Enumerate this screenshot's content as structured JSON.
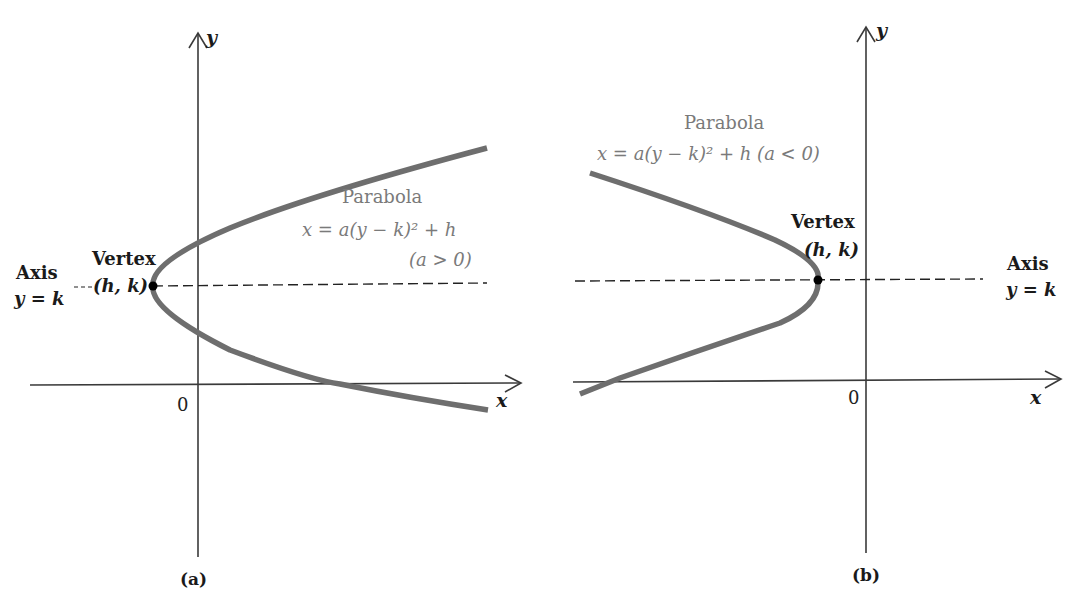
{
  "figure": {
    "panels": [
      {
        "id": "a",
        "caption": "(a)",
        "y_axis_label": "y",
        "x_axis_label": "x",
        "origin_label": "0",
        "curve_title": "Parabola",
        "equation": "x = a(y − k)² + h",
        "condition": "(a > 0)",
        "vertex_label": "Vertex",
        "vertex_coords": "(h, k)",
        "axis_label": "Axis",
        "axis_equation": "y = k",
        "opens": "right"
      },
      {
        "id": "b",
        "caption": "(b)",
        "y_axis_label": "y",
        "x_axis_label": "x",
        "origin_label": "0",
        "curve_title": "Parabola",
        "equation": "x = a(y − k)² + h (a < 0)",
        "vertex_label": "Vertex",
        "vertex_coords": "(h, k)",
        "axis_label": "Axis",
        "axis_equation": "y = k",
        "opens": "left"
      }
    ],
    "colors": {
      "curve": "#6e6e6e",
      "axes": "#3a3a3a",
      "text_dark": "#1a1a1a",
      "text_gray": "#7a7a7a",
      "vertex_dot": "#000000"
    }
  }
}
